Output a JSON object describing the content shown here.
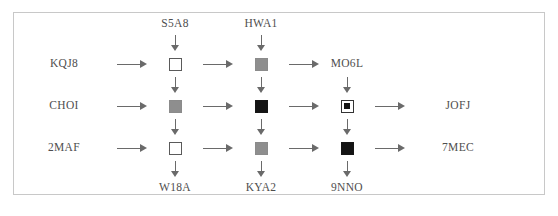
{
  "figure": {
    "type": "grid-flow-diagram",
    "border_color": "#c8c8c8",
    "background": "#ffffff",
    "text_color": "#4e4e4e",
    "arrow_color": "#6a6a6a",
    "marker_colors": {
      "open": "#ffffff",
      "gray": "#8e8e8e",
      "black": "#141414",
      "outline": "#5a5a5a"
    },
    "top_labels": [
      "S5A8",
      "HWA1"
    ],
    "left_labels": [
      "KQJ8",
      "CHOI",
      "2MAF"
    ],
    "right_labels": [
      "MO6L",
      "JOFJ",
      "7MEC"
    ],
    "bottom_labels": [
      "W18A",
      "KYA2",
      "9NNO"
    ],
    "nodes": [
      [
        {
          "style": "open",
          "label": ""
        },
        {
          "style": "gray",
          "label": ""
        },
        {
          "style": "none",
          "label": "MO6L"
        }
      ],
      [
        {
          "style": "gray",
          "label": ""
        },
        {
          "style": "black",
          "label": ""
        },
        {
          "style": "nested",
          "label": ""
        }
      ],
      [
        {
          "style": "open",
          "label": ""
        },
        {
          "style": "gray",
          "label": ""
        },
        {
          "style": "black",
          "label": ""
        }
      ]
    ],
    "arrow_glyph_horizontal": "→",
    "arrow_glyph_vertical": "↓"
  }
}
